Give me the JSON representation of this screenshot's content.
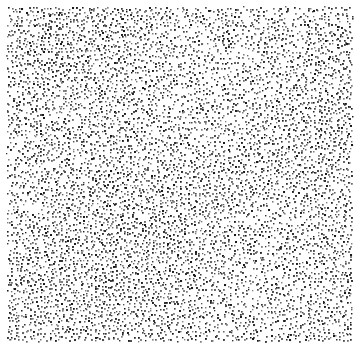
{
  "image": {
    "description": "Stippled dot pattern texture on white background",
    "width": 360,
    "height": 349,
    "background": "#ffffff"
  },
  "stipple": {
    "region": {
      "x": 8,
      "y": 8,
      "width": 344,
      "height": 332
    },
    "min_spacing": 3.6,
    "dot_size": 1.6,
    "dot_colors": [
      "#1a1a1a",
      "#333333",
      "#4d4d4d",
      "#666666",
      "#808080"
    ],
    "seed": 1337
  }
}
